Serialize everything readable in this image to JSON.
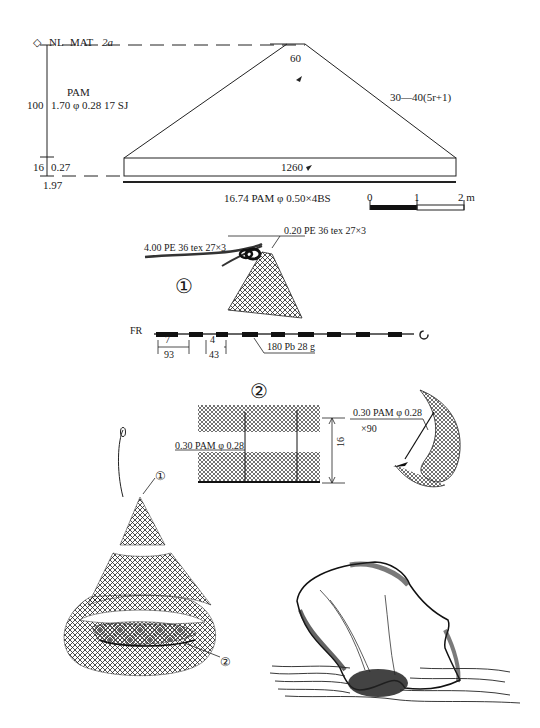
{
  "header": {
    "symbol": "◇",
    "nl": "NL",
    "mat": "MAT",
    "code": "2a"
  },
  "left_spec": {
    "depth_meshes": "100",
    "material": "PAM",
    "spec": "1.70 φ 0.28  17 SJ",
    "bottom_meshes": "16",
    "bottom_length": "0.27",
    "total_length": "1.97"
  },
  "net_outline": {
    "top_meshes": "60",
    "side_taper": "30—40(5r+1)",
    "bottom_meshes": "1260",
    "leadline": "16.74 PAM φ 0.50×4BS"
  },
  "scale_bar": {
    "ticks": [
      "0",
      "1",
      "2 m"
    ]
  },
  "detail_1": {
    "marker": "①",
    "handline": "4.00 PE 36 tex 27×3",
    "bridle": "0.20 PE 36 tex 27×3"
  },
  "footrope": {
    "label": "FR",
    "spacing_1": "7",
    "spacing_1_length": "93",
    "spacing_2": "4",
    "spacing_2_length": "43",
    "sinker": "180 Pb 28 g"
  },
  "detail_2": {
    "marker": "②",
    "tie_line": "0.30 PAM φ 0.28",
    "pocket_depth": "16",
    "tie_line_right": "0.30 PAM φ 0.28",
    "tie_count": "×90"
  },
  "assembled_net": {
    "marker_1": "①",
    "marker_2": "②"
  }
}
